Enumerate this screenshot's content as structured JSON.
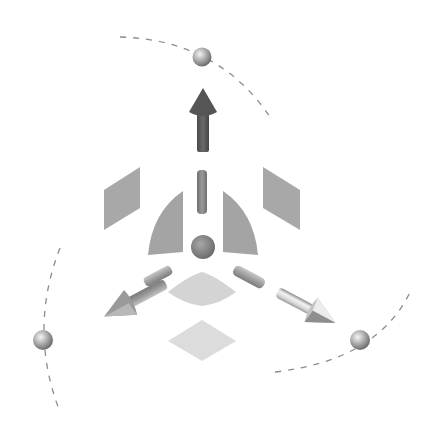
{
  "diagram": {
    "type": "3d-transform-gizmo",
    "colors": {
      "background": "#ffffff",
      "arrow_y": "#5a5a5a",
      "arrow_x": "#9a9a9a",
      "arrow_z": "#d0d0d0",
      "plane_handle": "#a8a8a8",
      "rotation_sector": "#a4a4a4",
      "bottom_plane": "#dcdcdc",
      "bottom_sector": "#d4d4d4",
      "center_sphere": "#8a8a8a",
      "rotation_sphere": "#b4b4b4",
      "dashed_arc": "#8c8c8c"
    },
    "elements": [
      {
        "name": "y-axis-translate-arrow",
        "direction": "up"
      },
      {
        "name": "x-axis-translate-arrow",
        "direction": "down-left"
      },
      {
        "name": "z-axis-translate-arrow",
        "direction": "down-right"
      },
      {
        "name": "center-handle-sphere"
      },
      {
        "name": "y-axis-stub"
      },
      {
        "name": "x-axis-stub"
      },
      {
        "name": "z-axis-stub"
      },
      {
        "name": "left-plane-handle"
      },
      {
        "name": "right-plane-handle"
      },
      {
        "name": "bottom-plane-handle"
      },
      {
        "name": "left-rotation-sector"
      },
      {
        "name": "right-rotation-sector"
      },
      {
        "name": "bottom-rotation-sector"
      },
      {
        "name": "top-rotation-sphere"
      },
      {
        "name": "left-rotation-sphere"
      },
      {
        "name": "right-rotation-sphere"
      },
      {
        "name": "top-rotation-arc"
      },
      {
        "name": "left-rotation-arc"
      },
      {
        "name": "right-rotation-arc"
      }
    ]
  }
}
